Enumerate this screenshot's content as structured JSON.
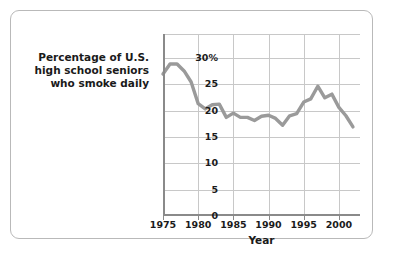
{
  "caption": {
    "line1": "Percentage of U.S.",
    "line2": "high school seniors",
    "line3": "who smoke daily",
    "full": "Percentage of U.S. high school seniors who smoke daily"
  },
  "axis": {
    "x_title": "Year",
    "y_ticks": [
      "30%",
      "25",
      "20",
      "15",
      "10",
      "5",
      "0"
    ],
    "x_ticks": [
      "1975",
      "1980",
      "1985",
      "1990",
      "1995",
      "2000"
    ]
  },
  "colors": {
    "line": "#9a9a9a",
    "grid": "#c8c8c8",
    "axis": "#8a8a8a",
    "border": "#b9b9b9",
    "text": "#1a1a1a",
    "background": "#ffffff"
  },
  "chart_data": {
    "type": "line",
    "title": "",
    "xlabel": "Year",
    "ylabel": "Percentage of U.S. high school seniors who smoke daily",
    "xlim": [
      1975,
      2003
    ],
    "ylim": [
      0,
      34.5
    ],
    "grid": true,
    "legend": "none",
    "x_tick_values": [
      1975,
      1980,
      1985,
      1990,
      1995,
      2000
    ],
    "y_tick_values": [
      0,
      5,
      10,
      15,
      20,
      25,
      30
    ],
    "y_tick_labels": [
      "0",
      "5",
      "10",
      "15",
      "20",
      "25",
      "30%"
    ],
    "x": [
      1975,
      1976,
      1977,
      1978,
      1979,
      1980,
      1981,
      1982,
      1983,
      1984,
      1985,
      1986,
      1987,
      1988,
      1989,
      1990,
      1991,
      1992,
      1993,
      1994,
      1995,
      1996,
      1997,
      1998,
      1999,
      2000,
      2001,
      2002
    ],
    "values": [
      26.9,
      28.8,
      28.8,
      27.5,
      25.4,
      21.3,
      20.3,
      21.1,
      21.2,
      18.7,
      19.5,
      18.7,
      18.7,
      18.1,
      18.9,
      19.1,
      18.5,
      17.2,
      19.0,
      19.4,
      21.6,
      22.2,
      24.6,
      22.4,
      23.1,
      20.6,
      19.0,
      16.9
    ],
    "series": [
      {
        "name": "Percentage of U.S. high school seniors who smoke daily",
        "values": [
          26.9,
          28.8,
          28.8,
          27.5,
          25.4,
          21.3,
          20.3,
          21.1,
          21.2,
          18.7,
          19.5,
          18.7,
          18.7,
          18.1,
          18.9,
          19.1,
          18.5,
          17.2,
          19.0,
          19.4,
          21.6,
          22.2,
          24.6,
          22.4,
          23.1,
          20.6,
          19.0,
          16.9
        ]
      }
    ]
  }
}
